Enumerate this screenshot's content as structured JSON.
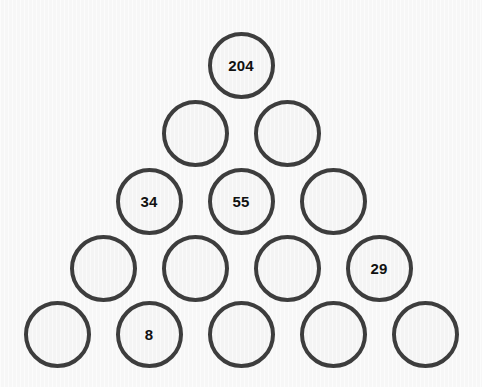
{
  "puzzle": {
    "name": "number-pyramid",
    "rows": 5,
    "colors": {
      "background": "#f7f7f7",
      "circle_fill": "#f4f4f4",
      "circle_stroke": "#3d3d3d",
      "text": "#111111"
    },
    "rows_data": [
      {
        "index": 1,
        "cells": [
          {
            "value": "204",
            "filled": true
          }
        ]
      },
      {
        "index": 2,
        "cells": [
          {
            "value": "",
            "filled": false
          },
          {
            "value": "",
            "filled": false
          }
        ]
      },
      {
        "index": 3,
        "cells": [
          {
            "value": "34",
            "filled": true
          },
          {
            "value": "55",
            "filled": true
          },
          {
            "value": "",
            "filled": false
          }
        ]
      },
      {
        "index": 4,
        "cells": [
          {
            "value": "",
            "filled": false
          },
          {
            "value": "",
            "filled": false
          },
          {
            "value": "",
            "filled": false
          },
          {
            "value": "29",
            "filled": true
          }
        ]
      },
      {
        "index": 5,
        "cells": [
          {
            "value": "",
            "filled": false
          },
          {
            "value": "8",
            "filled": true
          },
          {
            "value": "",
            "filled": false
          },
          {
            "value": "",
            "filled": false
          },
          {
            "value": "",
            "filled": false
          }
        ]
      }
    ]
  }
}
